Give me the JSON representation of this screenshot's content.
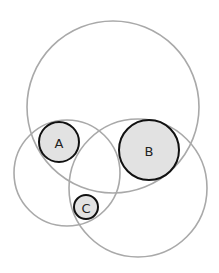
{
  "diagram": {
    "type": "euler-diagram",
    "colors": {
      "outer_stroke": "#a9a9a9",
      "inner_fill": "#e2e2e2",
      "inner_stroke": "#111111",
      "background": "#ffffff"
    },
    "outer_circles": [
      {
        "id": "top",
        "cx": 113,
        "cy": 107,
        "r": 86
      },
      {
        "id": "left",
        "cx": 67,
        "cy": 173,
        "r": 53
      },
      {
        "id": "right",
        "cx": 138,
        "cy": 188,
        "r": 69
      }
    ],
    "inner_circles": [
      {
        "id": "A",
        "label": "A",
        "cx": 59,
        "cy": 142,
        "r": 20
      },
      {
        "id": "B",
        "label": "B",
        "cx": 149,
        "cy": 150,
        "r": 30
      },
      {
        "id": "C",
        "label": "C",
        "cx": 86,
        "cy": 207,
        "r": 12
      }
    ]
  }
}
